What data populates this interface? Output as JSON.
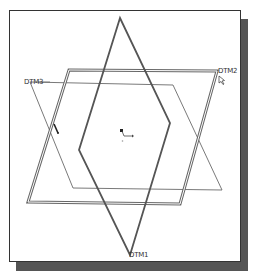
{
  "viewport": {
    "background": "#ffffff",
    "border_color": "#333333",
    "shadow_color": "#555555"
  },
  "datum_planes": [
    {
      "name": "DTM1",
      "label": "DTM1",
      "style": "thick",
      "color": "#555555",
      "points": "120,18 170,123 130,255 79,150"
    },
    {
      "name": "DTM2",
      "label": "DTM2",
      "style": "double",
      "color": "#666666",
      "points": "69,70 217,71 180,204 28,202"
    },
    {
      "name": "DTM3",
      "label": "DTM3",
      "style": "thin",
      "color": "#666666",
      "points": "30,82 173,85 222,190 73,188"
    }
  ],
  "labels": {
    "dtm1": "DTM1",
    "dtm2": "DTM2",
    "dtm3": "DTM3"
  },
  "icons": {
    "coordinate_system": "csys-icon",
    "cursor": "mouse-cursor-icon",
    "pointer": "selection-pointer-icon"
  }
}
